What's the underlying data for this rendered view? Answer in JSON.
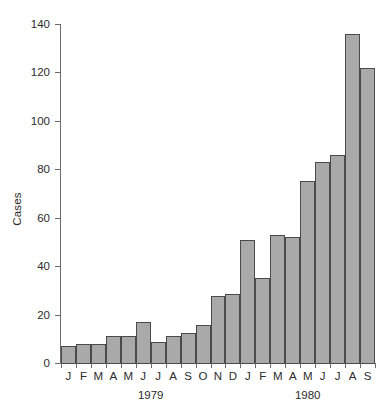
{
  "chart_data": {
    "type": "bar",
    "title": "",
    "xlabel": "",
    "ylabel": "Cases",
    "ylim": [
      0,
      140
    ],
    "yticks": [
      0,
      20,
      40,
      60,
      80,
      100,
      120,
      140
    ],
    "grid": false,
    "legend": null,
    "categories": [
      "J",
      "F",
      "M",
      "A",
      "M",
      "J",
      "J",
      "A",
      "S",
      "O",
      "N",
      "D",
      "J",
      "F",
      "M",
      "A",
      "M",
      "J",
      "J",
      "A",
      "S"
    ],
    "values": [
      7,
      8,
      8,
      11,
      11,
      17,
      8.5,
      11,
      12.5,
      15.5,
      27.5,
      28.5,
      51,
      35,
      53,
      52,
      75,
      83,
      86,
      136,
      122
    ],
    "group_labels": [
      "1979",
      "1980"
    ],
    "groups": [
      {
        "label": "1979",
        "start_index": 0,
        "end_index": 11
      },
      {
        "label": "1980",
        "start_index": 12,
        "end_index": 20
      }
    ],
    "bar_color": "#a9a9a9",
    "bar_edge_color": "#4a4a4a",
    "axis_color": "#6b6b6b",
    "text_color": "#2b2b2b",
    "background": "#ffffff"
  }
}
